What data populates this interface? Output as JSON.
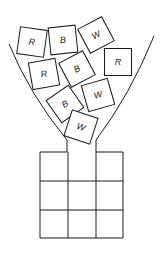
{
  "diagram": {
    "blocks": [
      {
        "label": "R",
        "cx": 32,
        "cy": 42,
        "rot": 8
      },
      {
        "label": "B",
        "cx": 63,
        "cy": 40,
        "rot": -6
      },
      {
        "label": "W",
        "cx": 96,
        "cy": 35,
        "rot": -28
      },
      {
        "label": "R",
        "cx": 44,
        "cy": 74,
        "rot": -10
      },
      {
        "label": "B",
        "cx": 77,
        "cy": 69,
        "rot": -28
      },
      {
        "label": "R",
        "cx": 118,
        "cy": 62,
        "rot": 0
      },
      {
        "label": "W",
        "cx": 98,
        "cy": 95,
        "rot": -16
      },
      {
        "label": "B",
        "cx": 65,
        "cy": 104,
        "rot": -35
      },
      {
        "label": "W",
        "cx": 81,
        "cy": 127,
        "rot": 18
      }
    ],
    "grid": {
      "rows": 3,
      "cols": 3
    }
  }
}
